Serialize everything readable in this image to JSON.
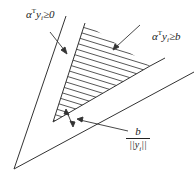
{
  "diagram": {
    "labels": {
      "half_space": {
        "prefix": "α",
        "sup": "T",
        "mid": "y",
        "sub": "i",
        "rel": "≥0"
      },
      "margin_region": {
        "prefix": "α",
        "sup": "T",
        "mid": "y",
        "sub": "i",
        "rel": "≥b"
      },
      "distance": {
        "numerator": "b",
        "denominator_left": "||y",
        "denominator_sub": "i",
        "denominator_right": "||"
      }
    },
    "colors": {
      "line": "#333333",
      "hatch": "#444444",
      "background": "#ffffff"
    }
  }
}
